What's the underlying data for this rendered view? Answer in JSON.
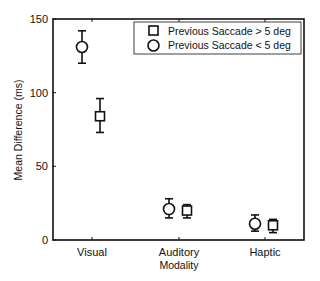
{
  "chart_data": {
    "type": "scatter",
    "title": "",
    "xlabel": "Modality",
    "ylabel": "Mean Difference (ms)",
    "categories": [
      "Visual",
      "Auditory",
      "Haptic"
    ],
    "ylim": [
      0,
      150
    ],
    "yticks": [
      0,
      50,
      100,
      150
    ],
    "grid": false,
    "legend_position": "upper right",
    "series": [
      {
        "name": "Previous Saccade > 5 deg",
        "marker": "square",
        "values": [
          84,
          20,
          10
        ],
        "error_low": [
          73,
          15,
          5
        ],
        "error_high": [
          96,
          24,
          14
        ]
      },
      {
        "name": "Previous Saccade < 5 deg",
        "marker": "circle",
        "values": [
          131,
          21,
          11
        ],
        "error_low": [
          120,
          15,
          6
        ],
        "error_high": [
          142,
          28,
          17
        ]
      }
    ]
  },
  "labels": {
    "ylabel": "Mean Difference (ms)",
    "xlabel": "Modality",
    "cat0": "Visual",
    "cat1": "Auditory",
    "cat2": "Haptic",
    "y0": "0",
    "y50": "50",
    "y100": "100",
    "y150": "150",
    "legend0": "Previous Saccade > 5 deg",
    "legend1": "Previous Saccade < 5 deg"
  }
}
